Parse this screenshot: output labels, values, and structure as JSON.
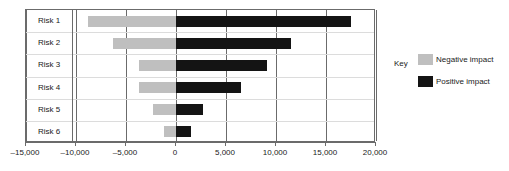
{
  "chart_data": {
    "type": "bar",
    "subtype": "tornado",
    "orientation": "horizontal",
    "title": "",
    "xlabel": "",
    "ylabel": "",
    "categories": [
      "Risk 1",
      "Risk 2",
      "Risk 3",
      "Risk 4",
      "Risk 5",
      "Risk 6"
    ],
    "series": [
      {
        "name": "Negative impact",
        "color": "#bfbfbf",
        "values": [
          -8800,
          -6300,
          -3700,
          -3700,
          -2300,
          -1200
        ]
      },
      {
        "name": "Positive impact",
        "color": "#141414",
        "values": [
          17500,
          11500,
          9100,
          6500,
          2700,
          1500
        ]
      }
    ],
    "xlim": [
      -15000,
      20000
    ],
    "xticks": [
      -15000,
      -10000,
      -5000,
      0,
      5000,
      10000,
      15000,
      20000
    ],
    "xticklabels": [
      "–15,000",
      "–10,000",
      "–5,000",
      "0",
      "5,000",
      "10,000",
      "15,000",
      "20,000"
    ],
    "grid": "vertical",
    "legend_position": "right"
  },
  "legend": {
    "title": "Key",
    "entries": [
      {
        "label": "Negative impact",
        "swatch": "neg"
      },
      {
        "label": "Positive impact",
        "swatch": "pos"
      }
    ]
  },
  "colors": {
    "negative": "#bfbfbf",
    "positive": "#141414",
    "axis": "#6b6b6b",
    "row_separator": "#dcdcdc",
    "background": "#ffffff"
  }
}
